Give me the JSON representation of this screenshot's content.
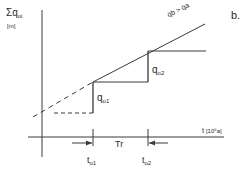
{
  "panel_label": "b.",
  "y_axis": {
    "symbol": "Σq",
    "subscript": "oi",
    "unit": "[m]"
  },
  "x_axis": {
    "symbol": "t",
    "unit": "[10⁶a]"
  },
  "slope_label": {
    "text": "q̇b > q̇a"
  },
  "steps": [
    {
      "symbol": "q",
      "subscript": "o1"
    },
    {
      "symbol": "q",
      "subscript": "o2"
    }
  ],
  "interval": {
    "label": "Tr"
  },
  "times": [
    {
      "symbol": "t",
      "subscript": "o1"
    },
    {
      "symbol": "t",
      "subscript": "o2"
    }
  ],
  "colors": {
    "line": "#3a3a3a",
    "background": "#ffffff"
  }
}
